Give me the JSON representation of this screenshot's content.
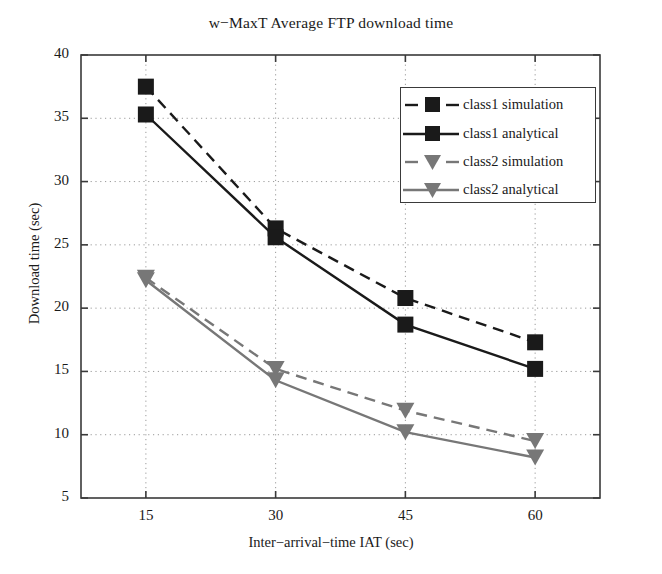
{
  "chart_data": {
    "type": "line",
    "title": "w−MaxT Average FTP download time",
    "xlabel": "Inter−arrival−time IAT (sec)",
    "ylabel": "Download time (sec)",
    "x": [
      15,
      30,
      45,
      60
    ],
    "xticklabels": [
      "15",
      "30",
      "45",
      "60"
    ],
    "yticklabels": [
      "5",
      "10",
      "15",
      "20",
      "25",
      "30",
      "35",
      "40"
    ],
    "yticks": [
      5,
      10,
      15,
      20,
      25,
      30,
      35,
      40
    ],
    "xlim": [
      7.5,
      67.5
    ],
    "ylim": [
      5,
      40
    ],
    "grid": true,
    "legend_position": "upper right",
    "series": [
      {
        "name": "class1 simulation",
        "values": [
          37.5,
          26.3,
          20.8,
          17.3
        ],
        "color": "#1a1a1a",
        "linestyle": "dashed",
        "marker": "square"
      },
      {
        "name": "class1 analytical",
        "values": [
          35.3,
          25.6,
          18.7,
          15.2
        ],
        "color": "#1a1a1a",
        "linestyle": "solid",
        "marker": "square"
      },
      {
        "name": "class2 simulation",
        "values": [
          22.4,
          15.2,
          11.9,
          9.5
        ],
        "color": "#777777",
        "linestyle": "dashed",
        "marker": "triangle-down"
      },
      {
        "name": "class2 analytical",
        "values": [
          22.2,
          14.3,
          10.2,
          8.2
        ],
        "color": "#777777",
        "linestyle": "solid",
        "marker": "triangle-down"
      }
    ]
  },
  "legend": {
    "entries": [
      {
        "label": "class1 simulation"
      },
      {
        "label": "class1 analytical"
      },
      {
        "label": "class2 simulation"
      },
      {
        "label": "class2 analytical"
      }
    ]
  }
}
